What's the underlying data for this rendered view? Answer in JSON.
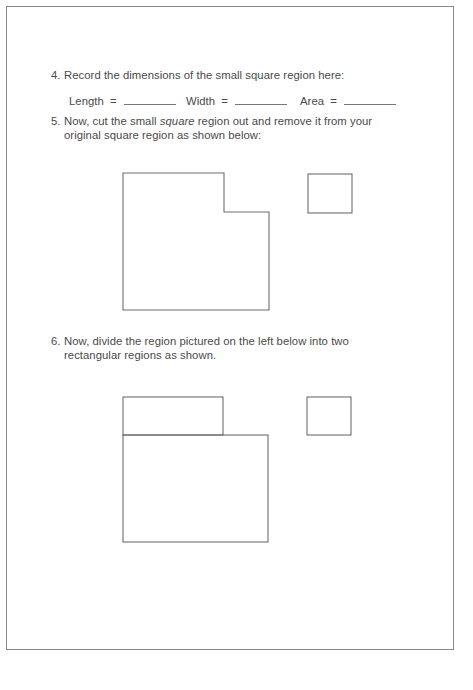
{
  "worksheet": {
    "item4": {
      "number": "4.",
      "text": "Record the dimensions of the small square region here:",
      "fields": [
        {
          "label": "Length",
          "eq": "=",
          "value": ""
        },
        {
          "label": "Width",
          "eq": "=",
          "value": ""
        },
        {
          "label": "Area",
          "eq": "=",
          "value": ""
        }
      ]
    },
    "item5": {
      "number": "5.",
      "line1_before": "Now, cut the small ",
      "line1_emph": "square",
      "line1_after": " region out and remove it from your",
      "line2": "original square region as shown below:"
    },
    "item6": {
      "number": "6.",
      "line1": "Now, divide the region pictured on the left below into two",
      "line2": "rectangular regions as shown."
    },
    "figures": {
      "figure1": {
        "description": "Large square with small square notch removed from top-right corner, beside the removed small square",
        "l_shape_points": "123,173 224,173 224,212 269,212 269,310 123,310",
        "small_square": {
          "x": 308,
          "y": 174,
          "w": 44,
          "h": 39
        }
      },
      "figure2": {
        "description": "L-shaped region divided into two rectangles, beside the small square",
        "top_rect": {
          "x": 123,
          "y": 397,
          "w": 100,
          "h": 38
        },
        "bottom_rect": {
          "x": 123,
          "y": 435,
          "w": 145,
          "h": 107
        },
        "small_square": {
          "x": 307,
          "y": 397,
          "w": 44,
          "h": 38
        }
      }
    },
    "colors": {
      "line": "#6e6e6e",
      "text": "#4a4a4a",
      "frame": "#8a8a8a"
    }
  }
}
